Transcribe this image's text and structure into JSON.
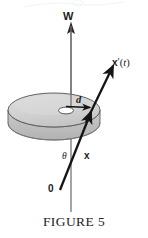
{
  "figure": {
    "caption": "FIGURE 5",
    "labels": {
      "axis_w": "W",
      "velocity_vector": "x′(t)",
      "velocity_vector_parts": {
        "base": "x",
        "prime": "′",
        "open_paren": "(",
        "variable": "t",
        "close_paren": ")"
      },
      "radius": "d",
      "angle": "θ",
      "position_vector": "x",
      "origin": "0"
    },
    "colors": {
      "ink": "#1b1b1b",
      "disk_top_fill": "#d2d2d2",
      "disk_side_fill": "#bdbdbd",
      "disk_outline": "#5a5a5a",
      "axis_line": "#6b6b6b",
      "vector_stroke": "#161616",
      "hole_fill": "#ffffff",
      "background": "#ffffff"
    },
    "geometry": {
      "axis_top_y": 22,
      "axis_bottom_y": 212,
      "axis_x": 71,
      "disk_center": [
        54,
        110
      ],
      "disk_radius_x": 46,
      "disk_radius_y": 17,
      "disk_thickness": 13,
      "origin_point": [
        61,
        191
      ],
      "contact_point": [
        92,
        112
      ],
      "velocity_tip": [
        112,
        67
      ],
      "radius_arrow_from": [
        61,
        106
      ],
      "radius_arrow_to": [
        91,
        106
      ]
    }
  }
}
